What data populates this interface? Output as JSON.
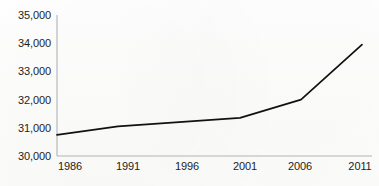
{
  "chart_data": {
    "type": "line",
    "title": "",
    "subtitle": "",
    "xlabel": "",
    "ylabel": "",
    "x": [
      1986,
      1991,
      1996,
      2001,
      2006,
      2011
    ],
    "categories": [
      "1986",
      "1991",
      "1996",
      "2001",
      "2006",
      "2011"
    ],
    "values": [
      30750,
      31050,
      31200,
      31350,
      32000,
      33950
    ],
    "series": [
      {
        "name": "series-1",
        "values": [
          30750,
          31050,
          31200,
          31350,
          32000,
          33950
        ]
      }
    ],
    "xlim": [
      1986,
      2011
    ],
    "ylim": [
      30000,
      35000
    ],
    "ytick_values": [
      30000,
      31000,
      32000,
      33000,
      34000,
      35000
    ],
    "ytick_labels": [
      "30,000",
      "31,000",
      "32,000",
      "33,000",
      "34,000",
      "35,000"
    ],
    "xtick_values": [
      1986,
      1991,
      1996,
      2001,
      2006,
      2011
    ],
    "xtick_labels": [
      "1986",
      "1991",
      "1996",
      "2001",
      "2006",
      "2011"
    ],
    "grid": false,
    "legend": false,
    "legend_position": "none",
    "markers": false,
    "annotations": []
  },
  "style": {
    "line_color": "#111111",
    "axis_color": "#b3b3b3",
    "text_color": "#1d1d1d",
    "background_color": "#ffffff",
    "line_width": 1.7
  },
  "geometry": {
    "plot_left": 57,
    "plot_right": 362,
    "plot_top": 15,
    "plot_bottom": 156
  }
}
